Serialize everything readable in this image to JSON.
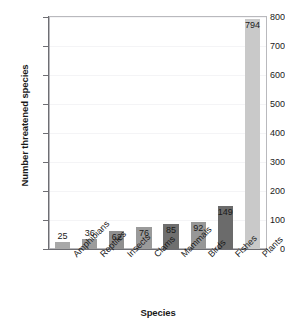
{
  "chart_data": {
    "type": "bar",
    "title": "",
    "xlabel": "Species",
    "ylabel": "Number threatened species",
    "categories": [
      "Amphibians",
      "Reptiles",
      "Insects",
      "Clams",
      "Mammals",
      "Birds",
      "Fishes",
      "Plants"
    ],
    "values": [
      25,
      36,
      62,
      76,
      85,
      92,
      149,
      794
    ],
    "value_labels": [
      "25",
      "36",
      "62",
      "76",
      "85",
      "92",
      "149",
      "794"
    ],
    "bar_colors": [
      "#a8a8a8",
      "#9c9c9c",
      "#8f8f8f",
      "#9a9a9a",
      "#6f6f6f",
      "#979797",
      "#6b6b6b",
      "#c9c9c9"
    ],
    "ylim": [
      0,
      800
    ],
    "yticks": [
      0,
      100,
      200,
      300,
      400,
      500,
      600,
      700,
      800
    ],
    "ytick_labels": [
      "0",
      "100",
      "200",
      "300",
      "400",
      "500",
      "600",
      "700",
      "800"
    ],
    "grid": true,
    "legend": "none",
    "label_rotation_deg": -45
  },
  "colors": {
    "background": "#ffffff",
    "axis": "#6e6e73",
    "plot_border": "#b9b9bd",
    "gridline": "#f4f4f6",
    "text": "#1a1a1a"
  }
}
